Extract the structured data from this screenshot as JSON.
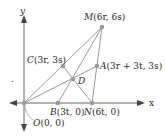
{
  "diagram": {
    "axes": {
      "x_label": "x",
      "y_label": "y"
    },
    "points": {
      "O": {
        "name": "O",
        "coords": "(0, 0)"
      },
      "B": {
        "name": "B",
        "coords": "(3t, 0)"
      },
      "N": {
        "name": "N",
        "coords": "(6t, 0)"
      },
      "C": {
        "name": "C",
        "coords": "(3r, 3s)"
      },
      "A": {
        "name": "A",
        "coords": "(3r + 3t, 3s)"
      },
      "M": {
        "name": "M",
        "coords": "(6r, 6s)"
      },
      "D": {
        "name": "D"
      }
    },
    "stray_mark": "."
  },
  "colors": {
    "line": "#9a9a9a",
    "point": "#9a9a9a",
    "axis": "#555555",
    "text": "#2a2a2a"
  }
}
